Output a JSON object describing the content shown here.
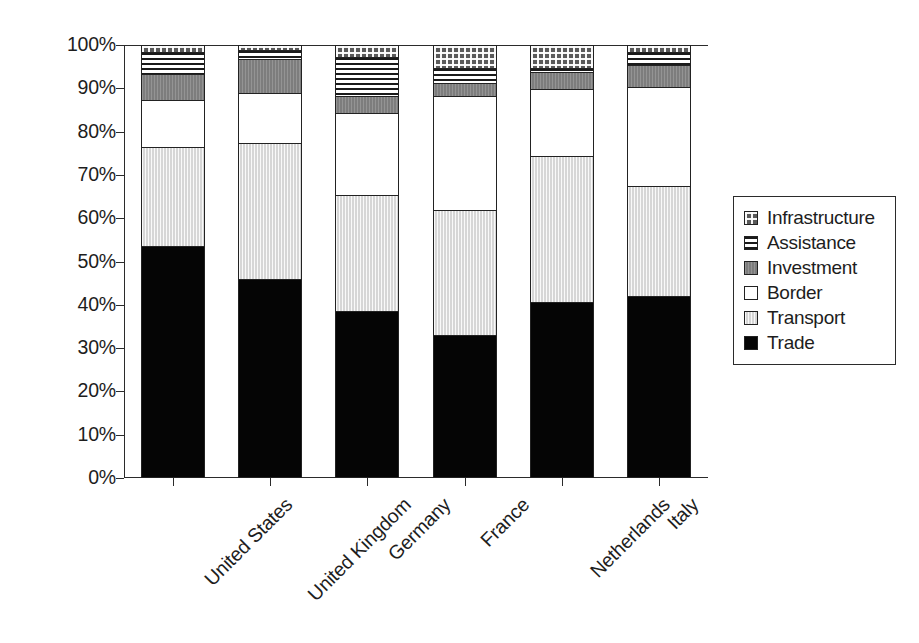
{
  "chart_data": {
    "type": "bar",
    "subtype": "stacked-100-percent",
    "title": "",
    "xlabel": "",
    "ylabel": "",
    "ylim": [
      0,
      100
    ],
    "ytick_labels": [
      "100%",
      "90%",
      "80%",
      "70%",
      "60%",
      "50%",
      "40%",
      "30%",
      "20%",
      "10%",
      "0%"
    ],
    "ytick_values": [
      100,
      90,
      80,
      70,
      60,
      50,
      40,
      30,
      20,
      10,
      0
    ],
    "grid": false,
    "legend_position": "right",
    "categories": [
      "United States",
      "United Kingdom",
      "Germany",
      "France",
      "Netherlands",
      "Italy"
    ],
    "series": [
      {
        "name": "Trade",
        "pattern": "solid-black",
        "values": [
          53.5,
          46.0,
          38.5,
          33.0,
          40.5,
          42.0
        ]
      },
      {
        "name": "Transport",
        "pattern": "light-gray",
        "values": [
          23.0,
          31.5,
          27.0,
          29.0,
          34.0,
          25.5
        ]
      },
      {
        "name": "Border",
        "pattern": "white",
        "values": [
          11.0,
          11.5,
          19.0,
          26.5,
          15.5,
          23.0
        ]
      },
      {
        "name": "Investment",
        "pattern": "dark-gray",
        "values": [
          6.0,
          8.0,
          4.0,
          3.0,
          4.0,
          5.0
        ]
      },
      {
        "name": "Assistance",
        "pattern": "horizontal-lines",
        "values": [
          5.0,
          2.0,
          9.0,
          3.5,
          1.0,
          3.0
        ]
      },
      {
        "name": "Infrastructure",
        "pattern": "checkerboard",
        "values": [
          1.5,
          1.0,
          2.5,
          5.0,
          5.0,
          1.5
        ]
      }
    ],
    "stack_order_bottom_to_top": [
      "Trade",
      "Transport",
      "Border",
      "Investment",
      "Assistance",
      "Infrastructure"
    ]
  },
  "legend": {
    "items": [
      {
        "label": "Infrastructure",
        "swatch": "checkerboard-swatch"
      },
      {
        "label": "Assistance",
        "swatch": "horizontal-lines-swatch"
      },
      {
        "label": "Investment",
        "swatch": "dark-gray-swatch"
      },
      {
        "label": "Border",
        "swatch": "white-swatch"
      },
      {
        "label": "Transport",
        "swatch": "light-gray-swatch"
      },
      {
        "label": "Trade",
        "swatch": "black-swatch"
      }
    ]
  },
  "colors": {
    "trade": "#050505",
    "transport": "#d6d6d6",
    "border": "#ffffff",
    "investment": "#7d7d7d",
    "assistance": "#ffffff",
    "infrastructure": "#5a5a5a",
    "axis": "#2b2b2b",
    "text": "#1d1d1d",
    "background": "#ffffff"
  }
}
